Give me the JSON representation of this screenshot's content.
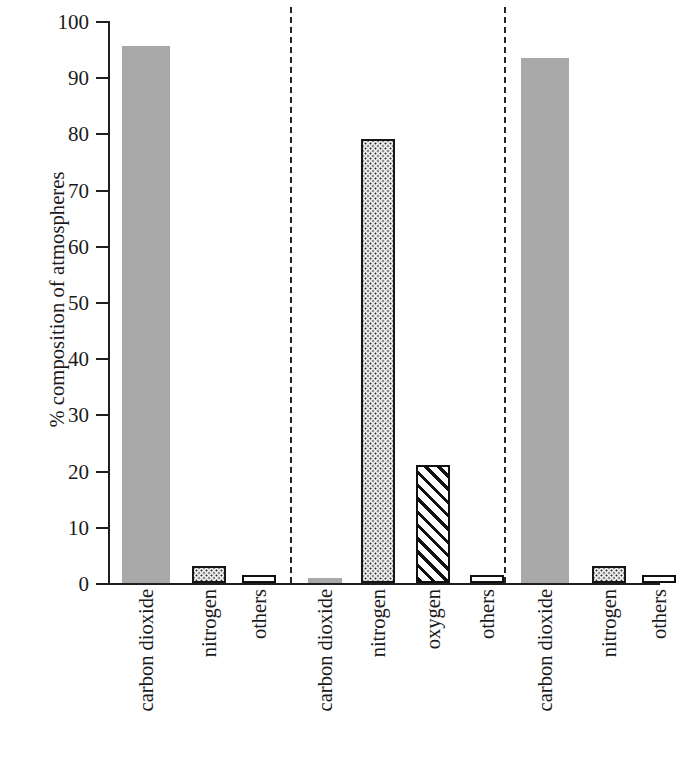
{
  "chart_data": {
    "type": "bar",
    "title": "",
    "subtitle": "",
    "xlabel": "",
    "ylabel": "% composition of atmospheres",
    "ylim": [
      0,
      100
    ],
    "ytick_labels": [
      "100",
      "90",
      "80",
      "70",
      "60",
      "50",
      "40",
      "30",
      "20",
      "10",
      "0"
    ],
    "yticks": [
      100,
      90,
      80,
      70,
      60,
      50,
      40,
      30,
      20,
      10,
      0
    ],
    "grid": false,
    "legend": "none",
    "group_separators": 2,
    "categories": [
      "carbon dioxide",
      "nitrogen",
      "others",
      "carbon dioxide",
      "nitrogen",
      "oxygen",
      "others",
      "carbon dioxide",
      "nitrogen",
      "others"
    ],
    "values": [
      95.5,
      3,
      1.5,
      0.9,
      79,
      21,
      1.5,
      93.5,
      3,
      1.5
    ],
    "bars": [
      {
        "group": 1,
        "label": "carbon dioxide",
        "value": 95.5,
        "fill": "solid-gray"
      },
      {
        "group": 1,
        "label": "nitrogen",
        "value": 3,
        "fill": "dotted"
      },
      {
        "group": 1,
        "label": "others",
        "value": 1.5,
        "fill": "white"
      },
      {
        "group": 2,
        "label": "carbon dioxide",
        "value": 0.9,
        "fill": "solid-gray"
      },
      {
        "group": 2,
        "label": "nitrogen",
        "value": 79,
        "fill": "dotted"
      },
      {
        "group": 2,
        "label": "oxygen",
        "value": 21,
        "fill": "hatch"
      },
      {
        "group": 2,
        "label": "others",
        "value": 1.5,
        "fill": "white"
      },
      {
        "group": 3,
        "label": "carbon dioxide",
        "value": 93.5,
        "fill": "solid-gray"
      },
      {
        "group": 3,
        "label": "nitrogen",
        "value": 3,
        "fill": "dotted"
      },
      {
        "group": 3,
        "label": "others",
        "value": 1.5,
        "fill": "white"
      }
    ],
    "colors": {
      "solid_gray_fill": "#a9a9a9",
      "outline": "#111111",
      "axis": "#1f1f1f",
      "separator": "#242424",
      "background": "#ffffff"
    }
  }
}
